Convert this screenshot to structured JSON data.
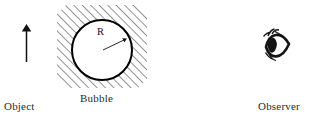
{
  "figure": {
    "type": "optics-ray-diagram",
    "canvas": {
      "width": 311,
      "height": 122,
      "background": "#ffffff"
    },
    "ink_color": "#1a1a1a",
    "labels": {
      "object": "Object",
      "bubble": "Bubble",
      "observer": "Observer",
      "radius": "R"
    },
    "object_arrow": {
      "name": "object-arrow",
      "direction": "up",
      "x": 26,
      "y_tail": 62,
      "y_head": 25
    },
    "bubble": {
      "name": "bubble-circle",
      "center_x": 102,
      "center_y": 50,
      "radius": 30,
      "fill": "#ffffff",
      "stroke": "#000000",
      "stroke_width": 2
    },
    "medium": {
      "name": "hatched-medium",
      "description": "diagonal hatched square surrounding the bubble",
      "left": 57,
      "top": 5,
      "right": 147,
      "bottom": 88,
      "hatch_angle_deg": 45,
      "hatch_spacing": 6,
      "hatch_color": "#3a3a3a"
    },
    "radius_arrow": {
      "name": "radius-arrow",
      "from_x": 102,
      "from_y": 50,
      "to_x": 127,
      "to_y": 38
    },
    "observer_eye": {
      "name": "observer-eye",
      "center_x": 276,
      "center_y": 46
    }
  }
}
